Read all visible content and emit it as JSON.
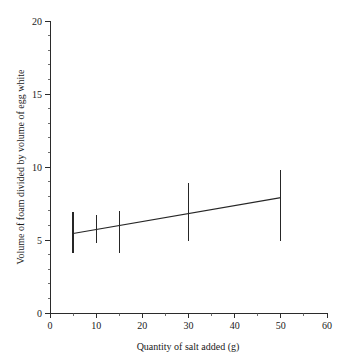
{
  "chart_data": {
    "type": "scatter",
    "title": "",
    "xlabel": "Quantity of salt added (g)",
    "ylabel": "Volume of foam divided by volume of egg white",
    "xlim": [
      0,
      60
    ],
    "ylim": [
      0,
      20
    ],
    "grid": false,
    "legend": "none",
    "x_ticks_major": [
      0,
      10,
      20,
      30,
      40,
      50,
      60
    ],
    "x_tick_labels": [
      "0",
      "10",
      "20",
      "30",
      "40",
      "50",
      "60"
    ],
    "x_ticks_minor": [
      5,
      15,
      25,
      35,
      45,
      55
    ],
    "y_ticks_major": [
      0,
      5,
      10,
      15,
      20
    ],
    "y_tick_labels": [
      "0",
      "5",
      "10",
      "15",
      "20"
    ],
    "y_ticks_minor": [
      1,
      2,
      3,
      4,
      6,
      7,
      8,
      9,
      11,
      12,
      13,
      14,
      16,
      17,
      18,
      19
    ],
    "x": [
      5,
      10,
      15,
      30,
      50
    ],
    "values": [
      5.5,
      5.7,
      6.0,
      6.8,
      7.9
    ],
    "error_bars": [
      {
        "x": 5,
        "mean": 5.5,
        "low": 4.1,
        "high": 6.9
      },
      {
        "x": 10,
        "mean": 5.7,
        "low": 4.8,
        "high": 6.7
      },
      {
        "x": 15,
        "mean": 6.0,
        "low": 4.1,
        "high": 7.0
      },
      {
        "x": 30,
        "mean": 6.8,
        "low": 4.95,
        "high": 8.9
      },
      {
        "x": 50,
        "mean": 7.9,
        "low": 4.9,
        "high": 9.8
      }
    ],
    "trend_line": {
      "x_start": 5,
      "y_start": 5.45,
      "x_end": 50,
      "y_end": 7.9
    },
    "colors": {
      "line": "#262626",
      "errorbar": "#262626",
      "axis": "#2b2b2b",
      "background": "#ffffff",
      "text": "#1a1a1a"
    }
  }
}
